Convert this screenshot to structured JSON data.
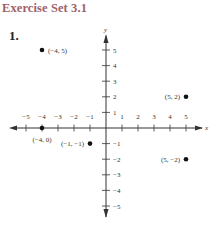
{
  "header": {
    "title": "Exercise Set 3.1"
  },
  "exercise": {
    "number": "1."
  },
  "chart_data": {
    "type": "scatter",
    "title": "",
    "xlabel": "x",
    "ylabel": "y",
    "xlim": [
      -5,
      5
    ],
    "ylim": [
      -5,
      5
    ],
    "x_ticks": [
      "-5",
      "-4",
      "-3",
      "-2",
      "-1",
      "1",
      "2",
      "3",
      "4",
      "5"
    ],
    "y_ticks": [
      "5",
      "4",
      "3",
      "2",
      "1",
      "-1",
      "-2",
      "-3",
      "-4",
      "-5"
    ],
    "grid": false,
    "points": [
      {
        "x": -4,
        "y": 5,
        "label": "(−4, 5)"
      },
      {
        "x": 5,
        "y": 2,
        "label": "(5, 2)"
      },
      {
        "x": -4,
        "y": 0,
        "label": "(−4, 0)"
      },
      {
        "x": -1,
        "y": -1,
        "label": "(−1, −1)"
      },
      {
        "x": 5,
        "y": -2,
        "label": "(5, −2)"
      }
    ]
  }
}
